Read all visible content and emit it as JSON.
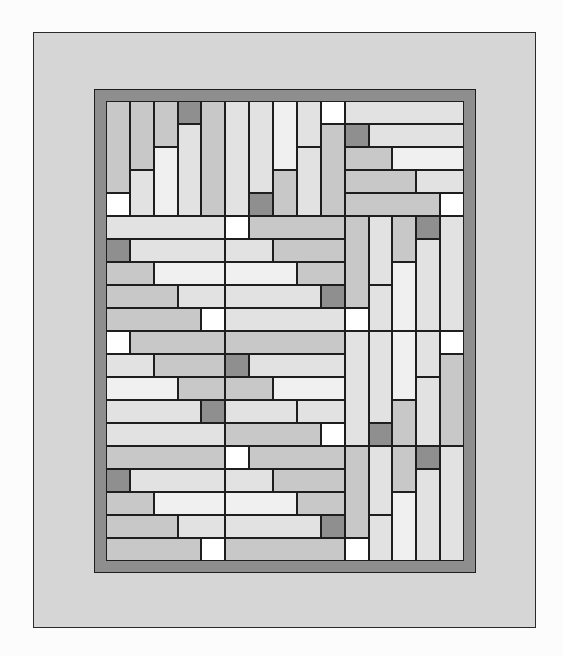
{
  "colors": {
    "background": "#fcfcfc",
    "outer_border_fill": "#d6d6d6",
    "inner_border_fill": "#8e8e8e",
    "line": "#1e1e1e",
    "white": "#ffffff",
    "lightest": "#f0f0f0",
    "light": "#e2e2e2",
    "medium": "#c8c8c8",
    "dark": "#8f8f8f"
  },
  "grid": {
    "cols": 3,
    "rows": 4,
    "units_per_block": 5
  },
  "blocks": [
    {
      "row": 0,
      "col": 0,
      "orientation": "vertical",
      "strips": [
        [
          [
            "medium",
            4
          ],
          [
            "white",
            1
          ]
        ],
        [
          [
            "medium",
            3
          ],
          [
            "light",
            2
          ]
        ],
        [
          [
            "medium",
            2
          ],
          [
            "lightest",
            3
          ]
        ],
        [
          [
            "dark",
            1
          ],
          [
            "light",
            4
          ]
        ],
        [
          [
            "medium",
            5
          ]
        ]
      ]
    },
    {
      "row": 0,
      "col": 1,
      "orientation": "vertical",
      "strips": [
        [
          [
            "light",
            5
          ]
        ],
        [
          [
            "light",
            4
          ],
          [
            "dark",
            1
          ]
        ],
        [
          [
            "lightest",
            3
          ],
          [
            "medium",
            2
          ]
        ],
        [
          [
            "light",
            2
          ],
          [
            "light",
            3
          ]
        ],
        [
          [
            "white",
            1
          ],
          [
            "medium",
            4
          ]
        ]
      ]
    },
    {
      "row": 0,
      "col": 2,
      "orientation": "horizontal",
      "strips": [
        [
          [
            "light",
            5
          ]
        ],
        [
          [
            "dark",
            1
          ],
          [
            "light",
            4
          ]
        ],
        [
          [
            "medium",
            2
          ],
          [
            "lightest",
            3
          ]
        ],
        [
          [
            "medium",
            3
          ],
          [
            "light",
            2
          ]
        ],
        [
          [
            "medium",
            4
          ],
          [
            "white",
            1
          ]
        ]
      ]
    },
    {
      "row": 1,
      "col": 0,
      "orientation": "horizontal",
      "strips": [
        [
          [
            "light",
            5
          ]
        ],
        [
          [
            "dark",
            1
          ],
          [
            "light",
            4
          ]
        ],
        [
          [
            "medium",
            2
          ],
          [
            "lightest",
            3
          ]
        ],
        [
          [
            "medium",
            3
          ],
          [
            "light",
            2
          ]
        ],
        [
          [
            "medium",
            4
          ],
          [
            "white",
            1
          ]
        ]
      ]
    },
    {
      "row": 1,
      "col": 1,
      "orientation": "horizontal",
      "strips": [
        [
          [
            "white",
            1
          ],
          [
            "medium",
            4
          ]
        ],
        [
          [
            "light",
            2
          ],
          [
            "medium",
            3
          ]
        ],
        [
          [
            "lightest",
            3
          ],
          [
            "medium",
            2
          ]
        ],
        [
          [
            "light",
            4
          ],
          [
            "dark",
            1
          ]
        ],
        [
          [
            "light",
            5
          ]
        ]
      ]
    },
    {
      "row": 1,
      "col": 2,
      "orientation": "vertical",
      "strips": [
        [
          [
            "medium",
            4
          ],
          [
            "white",
            1
          ]
        ],
        [
          [
            "light",
            3
          ],
          [
            "light",
            2
          ]
        ],
        [
          [
            "medium",
            2
          ],
          [
            "lightest",
            3
          ]
        ],
        [
          [
            "dark",
            1
          ],
          [
            "light",
            4
          ]
        ],
        [
          [
            "light",
            5
          ]
        ]
      ]
    },
    {
      "row": 2,
      "col": 0,
      "orientation": "horizontal",
      "strips": [
        [
          [
            "white",
            1
          ],
          [
            "medium",
            4
          ]
        ],
        [
          [
            "light",
            2
          ],
          [
            "medium",
            3
          ]
        ],
        [
          [
            "lightest",
            3
          ],
          [
            "medium",
            2
          ]
        ],
        [
          [
            "light",
            4
          ],
          [
            "dark",
            1
          ]
        ],
        [
          [
            "light",
            5
          ]
        ]
      ]
    },
    {
      "row": 2,
      "col": 1,
      "orientation": "horizontal",
      "strips": [
        [
          [
            "medium",
            5
          ]
        ],
        [
          [
            "dark",
            1
          ],
          [
            "light",
            4
          ]
        ],
        [
          [
            "medium",
            2
          ],
          [
            "lightest",
            3
          ]
        ],
        [
          [
            "light",
            3
          ],
          [
            "light",
            2
          ]
        ],
        [
          [
            "medium",
            4
          ],
          [
            "white",
            1
          ]
        ]
      ]
    },
    {
      "row": 2,
      "col": 2,
      "orientation": "vertical",
      "strips": [
        [
          [
            "light",
            5
          ]
        ],
        [
          [
            "light",
            4
          ],
          [
            "dark",
            1
          ]
        ],
        [
          [
            "lightest",
            3
          ],
          [
            "medium",
            2
          ]
        ],
        [
          [
            "light",
            2
          ],
          [
            "light",
            3
          ]
        ],
        [
          [
            "white",
            1
          ],
          [
            "medium",
            4
          ]
        ]
      ]
    },
    {
      "row": 3,
      "col": 0,
      "orientation": "horizontal",
      "strips": [
        [
          [
            "medium",
            5
          ]
        ],
        [
          [
            "dark",
            1
          ],
          [
            "light",
            4
          ]
        ],
        [
          [
            "medium",
            2
          ],
          [
            "lightest",
            3
          ]
        ],
        [
          [
            "medium",
            3
          ],
          [
            "light",
            2
          ]
        ],
        [
          [
            "medium",
            4
          ],
          [
            "white",
            1
          ]
        ]
      ]
    },
    {
      "row": 3,
      "col": 1,
      "orientation": "horizontal",
      "strips": [
        [
          [
            "white",
            1
          ],
          [
            "medium",
            4
          ]
        ],
        [
          [
            "light",
            2
          ],
          [
            "medium",
            3
          ]
        ],
        [
          [
            "lightest",
            3
          ],
          [
            "medium",
            2
          ]
        ],
        [
          [
            "light",
            4
          ],
          [
            "dark",
            1
          ]
        ],
        [
          [
            "medium",
            5
          ]
        ]
      ]
    },
    {
      "row": 3,
      "col": 2,
      "orientation": "vertical",
      "strips": [
        [
          [
            "medium",
            4
          ],
          [
            "white",
            1
          ]
        ],
        [
          [
            "light",
            3
          ],
          [
            "light",
            2
          ]
        ],
        [
          [
            "medium",
            2
          ],
          [
            "lightest",
            3
          ]
        ],
        [
          [
            "dark",
            1
          ],
          [
            "light",
            4
          ]
        ],
        [
          [
            "light",
            5
          ]
        ]
      ]
    }
  ]
}
